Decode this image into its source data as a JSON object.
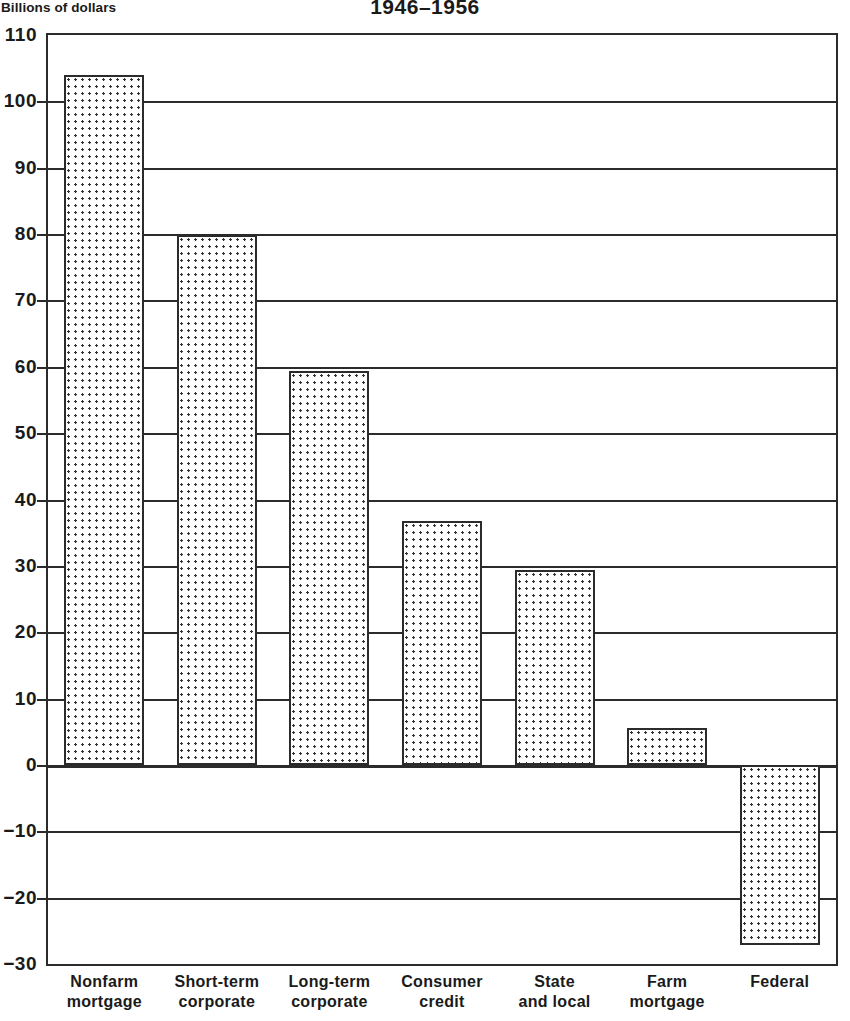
{
  "chart_data": {
    "type": "bar",
    "title": "1946–1956",
    "ylabel": "Billions of dollars",
    "xlabel": "",
    "categories": [
      "Nonfarm\nmortgage",
      "Short-term\ncorporate",
      "Long-term\ncorporate",
      "Consumer\ncredit",
      "State\nand local",
      "Farm\nmortgage",
      "Federal"
    ],
    "values": [
      104.0,
      79.8,
      59.4,
      36.7,
      29.4,
      5.6,
      -27.2
    ],
    "ylim": [
      -30,
      110
    ],
    "ytick_step": 10,
    "ytick_labels": [
      "110",
      "100",
      "90",
      "80",
      "70",
      "60",
      "50",
      "40",
      "30",
      "20",
      "10",
      "0",
      "−10",
      "−20",
      "−30"
    ],
    "ytick_values": [
      110,
      100,
      90,
      80,
      70,
      60,
      50,
      40,
      30,
      20,
      10,
      0,
      -10,
      -20,
      -30
    ],
    "grid": true,
    "legend": "none",
    "series_name": "Net change in debt outstanding",
    "bar_color": "#ffffff",
    "bar_border_color": "#2b2b2b",
    "bar_fill_pattern": "dotted",
    "axis_color": "#2b2b2b",
    "background": "#ffffff"
  }
}
